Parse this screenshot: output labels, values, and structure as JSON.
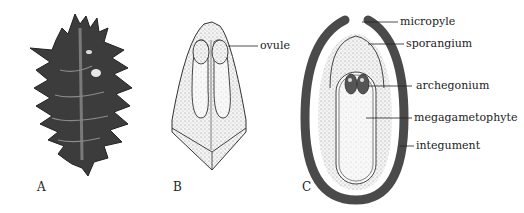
{
  "figure": {
    "panels": [
      {
        "id": "A",
        "letter": "A",
        "description": "cone scale photograph"
      },
      {
        "id": "B",
        "letter": "B",
        "description": "ovuliferous scale with two ovules"
      },
      {
        "id": "C",
        "letter": "C",
        "description": "ovule longitudinal section"
      }
    ],
    "labels": {
      "ovule": "ovule",
      "micropyle": "micropyle",
      "sporangium": "sporangium",
      "archegonium": "archegonium",
      "megagametophyte": "megagametophyte",
      "integument": "integument"
    },
    "colors": {
      "integument": "#4a4a4a",
      "stipple": "#c8c8c8",
      "outline": "#333333",
      "cone": "#3c3c3c"
    }
  }
}
